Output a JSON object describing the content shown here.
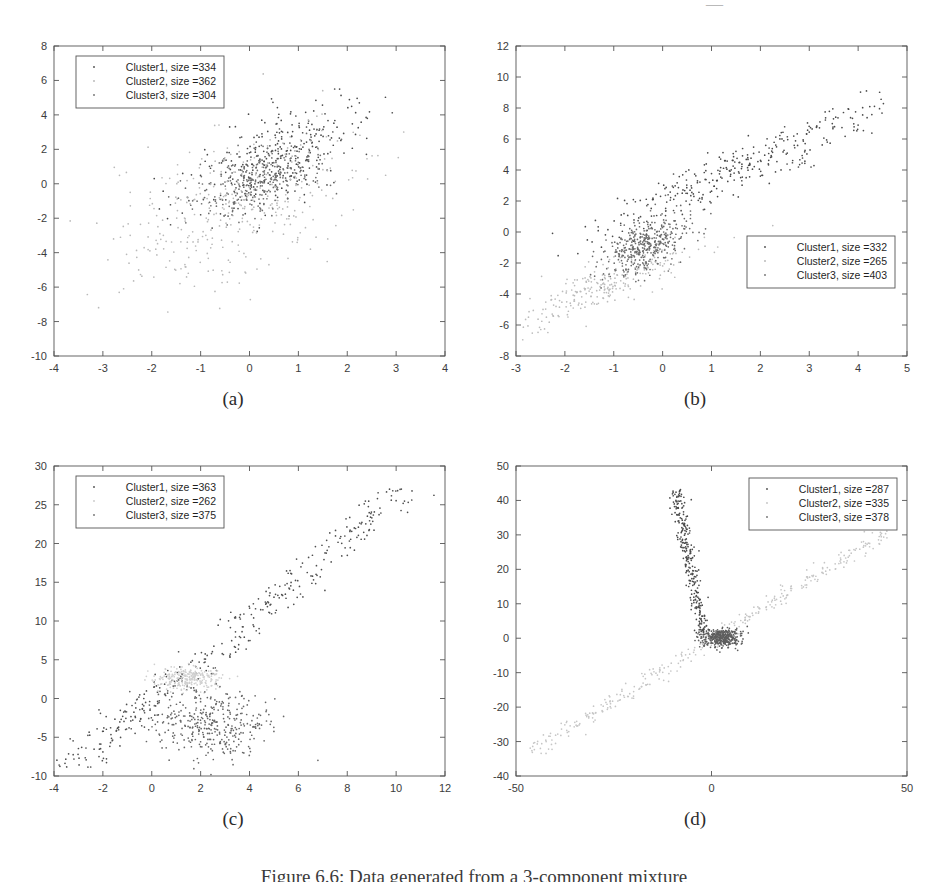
{
  "figure": {
    "caption": "Figure 6.6: Data generated from a 3-component mixture",
    "top_artifact": "—"
  },
  "chart_data": [
    {
      "id": "a",
      "type": "scatter",
      "title": "",
      "subcaption": "(a)",
      "xlabel": "",
      "ylabel": "",
      "xlim": [
        -4,
        4
      ],
      "ylim": [
        -10,
        8
      ],
      "xticks": [
        -4,
        -3,
        -2,
        -1,
        0,
        1,
        2,
        3,
        4
      ],
      "xtick_labels": [
        "-4",
        "-3",
        "-2",
        "-1",
        "0",
        "1",
        "2",
        "3",
        "4"
      ],
      "yticks": [
        -10,
        -8,
        -6,
        -4,
        -2,
        0,
        2,
        4,
        6,
        8
      ],
      "ytick_labels": [
        "-10",
        "-8",
        "-6",
        "-4",
        "-2",
        "0",
        "2",
        "4",
        "6",
        "8"
      ],
      "grid": false,
      "legend_position": "upper-left",
      "legend": [
        {
          "label": "Cluster1, size =334",
          "cluster": "Cluster1",
          "size": 334,
          "color": "#4a4a4a"
        },
        {
          "label": "Cluster2, size =362",
          "cluster": "Cluster2",
          "size": 362,
          "color": "#b4b4b4"
        },
        {
          "label": "Cluster3, size =304",
          "cluster": "Cluster3",
          "size": 304,
          "color": "#6e6e6e"
        }
      ],
      "series": [
        {
          "name": "Cluster1",
          "size": 334,
          "color": "#4a4a4a",
          "shape": "gaussian",
          "cx": 0.55,
          "cy": 1.35,
          "sx": 0.85,
          "sy": 1.5,
          "rho": 0.6
        },
        {
          "name": "Cluster2",
          "size": 362,
          "color": "#b9b9b9",
          "shape": "gaussian",
          "cx": -0.4,
          "cy": -1.4,
          "sx": 1.25,
          "sy": 2.3,
          "rho": 0.45
        },
        {
          "name": "Cluster3",
          "size": 304,
          "color": "#6e6e6e",
          "shape": "gaussian",
          "cx": 0.15,
          "cy": 0.2,
          "sx": 0.7,
          "sy": 1.1,
          "rho": 0.5
        }
      ]
    },
    {
      "id": "b",
      "type": "scatter",
      "title": "",
      "subcaption": "(b)",
      "xlabel": "",
      "ylabel": "",
      "xlim": [
        -3,
        5
      ],
      "ylim": [
        -8,
        12
      ],
      "xticks": [
        -3,
        -2,
        -1,
        0,
        1,
        2,
        3,
        4,
        5
      ],
      "xtick_labels": [
        "-3",
        "-2",
        "-1",
        "0",
        "1",
        "2",
        "3",
        "4",
        "5"
      ],
      "yticks": [
        -8,
        -6,
        -4,
        -2,
        0,
        2,
        4,
        6,
        8,
        10,
        12
      ],
      "ytick_labels": [
        "-8",
        "-6",
        "-4",
        "-2",
        "0",
        "2",
        "4",
        "6",
        "8",
        "10",
        "12"
      ],
      "grid": false,
      "legend_position": "mid-right",
      "legend": [
        {
          "label": "Cluster1, size =332",
          "cluster": "Cluster1",
          "size": 332,
          "color": "#4a4a4a"
        },
        {
          "label": "Cluster2, size =265",
          "cluster": "Cluster2",
          "size": 265,
          "color": "#b4b4b4"
        },
        {
          "label": "Cluster3, size =403",
          "cluster": "Cluster3",
          "size": 403,
          "color": "#6e6e6e"
        }
      ],
      "series": [
        {
          "name": "Cluster1",
          "size": 332,
          "color": "#4a4a4a",
          "shape": "elongated",
          "cx": 1.5,
          "cy": 4.0,
          "angle": 56,
          "len": 2.9,
          "wid": 0.45
        },
        {
          "name": "Cluster2",
          "size": 265,
          "color": "#bcbcbc",
          "shape": "elongated",
          "cx": -1.2,
          "cy": -3.4,
          "angle": 56,
          "len": 1.7,
          "wid": 0.4
        },
        {
          "name": "Cluster3",
          "size": 403,
          "color": "#6a6a6a",
          "shape": "gaussian",
          "cx": -0.35,
          "cy": -0.8,
          "sx": 0.45,
          "sy": 1.0,
          "rho": 0.55
        }
      ]
    },
    {
      "id": "c",
      "type": "scatter",
      "title": "",
      "subcaption": "(c)",
      "xlabel": "",
      "ylabel": "",
      "xlim": [
        -4,
        12
      ],
      "ylim": [
        -10,
        30
      ],
      "xticks": [
        -4,
        -2,
        0,
        2,
        4,
        6,
        8,
        10,
        12
      ],
      "xtick_labels": [
        "-4",
        "-2",
        "0",
        "2",
        "4",
        "6",
        "8",
        "10",
        "12"
      ],
      "yticks": [
        -10,
        -5,
        0,
        5,
        10,
        15,
        20,
        25,
        30
      ],
      "ytick_labels": [
        "-10",
        "-5",
        "0",
        "5",
        "10",
        "15",
        "20",
        "25",
        "30"
      ],
      "grid": false,
      "legend_position": "upper-left",
      "legend": [
        {
          "label": "Cluster1, size =363",
          "cluster": "Cluster1",
          "size": 363,
          "color": "#4a4a4a"
        },
        {
          "label": "Cluster2, size =262",
          "cluster": "Cluster2",
          "size": 262,
          "color": "#c8c8c8"
        },
        {
          "label": "Cluster3, size =375",
          "cluster": "Cluster3",
          "size": 375,
          "color": "#6e6e6e"
        }
      ],
      "series": [
        {
          "name": "Cluster1",
          "size": 363,
          "color": "#4e4e4e",
          "shape": "line",
          "x0": -3.4,
          "y0": -9.2,
          "x1": 10.4,
          "y1": 27.0,
          "spread": 0.55
        },
        {
          "name": "Cluster2",
          "size": 262,
          "color": "#cfcfcf",
          "shape": "gaussian",
          "cx": 1.5,
          "cy": 2.6,
          "sx": 0.7,
          "sy": 0.75,
          "rho": 0.1
        },
        {
          "name": "Cluster3",
          "size": 375,
          "color": "#676767",
          "shape": "gaussian",
          "cx": 2.4,
          "cy": -3.3,
          "sx": 1.25,
          "sy": 2.3,
          "rho": -0.25
        }
      ]
    },
    {
      "id": "d",
      "type": "scatter",
      "title": "",
      "subcaption": "(d)",
      "xlabel": "",
      "ylabel": "",
      "xlim": [
        -50,
        50
      ],
      "ylim": [
        -40,
        50
      ],
      "xticks": [
        -50,
        0,
        50
      ],
      "xtick_labels": [
        "-50",
        "0",
        "50"
      ],
      "yticks": [
        -40,
        -30,
        -20,
        -10,
        0,
        10,
        20,
        30,
        40,
        50
      ],
      "ytick_labels": [
        "-40",
        "-30",
        "-20",
        "-10",
        "0",
        "10",
        "20",
        "30",
        "40",
        "50"
      ],
      "grid": false,
      "legend_position": "upper-right",
      "legend": [
        {
          "label": "Cluster1, size =287",
          "cluster": "Cluster1",
          "size": 287,
          "color": "#4a4a4a"
        },
        {
          "label": "Cluster2, size =335",
          "cluster": "Cluster2",
          "size": 335,
          "color": "#c2c2c2"
        },
        {
          "label": "Cluster3, size =378",
          "cluster": "Cluster3",
          "size": 378,
          "color": "#6e6e6e"
        }
      ],
      "series": [
        {
          "name": "Cluster1",
          "size": 287,
          "color": "#4a4a4a",
          "shape": "line",
          "x0": -9.0,
          "y0": 43.0,
          "x1": -2.0,
          "y1": 1.0,
          "spread": 0.9
        },
        {
          "name": "Cluster2",
          "size": 335,
          "color": "#c6c6c6",
          "shape": "line",
          "x0": -46.0,
          "y0": -33.0,
          "x1": 45.0,
          "y1": 31.0,
          "spread": 1.1
        },
        {
          "name": "Cluster3",
          "size": 378,
          "color": "#5e5e5e",
          "shape": "gaussian",
          "cx": 2.5,
          "cy": 0.3,
          "sx": 2.6,
          "sy": 1.3,
          "rho": 0.1
        }
      ]
    }
  ]
}
